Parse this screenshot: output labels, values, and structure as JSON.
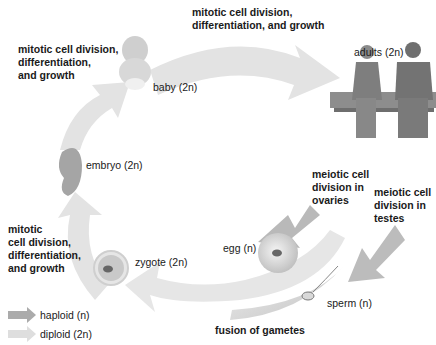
{
  "stages": {
    "baby": "baby (2n)",
    "adults": "adults (2n)",
    "embryo": "embryo (2n)",
    "zygote": "zygote (2n)",
    "egg": "egg (n)",
    "sperm": "sperm (n)"
  },
  "processes": {
    "top_left": [
      "mitotic cell division,",
      "differentiation,",
      "and growth"
    ],
    "top": [
      "mitotic cell division,",
      "differentiation, and growth"
    ],
    "left": [
      "mitotic",
      "cell division,",
      "differentiation,",
      "and growth"
    ],
    "ovaries": [
      "meiotic cell",
      "division in",
      "ovaries"
    ],
    "testes": [
      "meiotic cell",
      "division in",
      "testes"
    ],
    "fusion": "fusion of gametes"
  },
  "legend": [
    {
      "label": "haploid (n)",
      "color": "#a9a9a9"
    },
    {
      "label": "diploid (2n)",
      "color": "#dcdcdc"
    }
  ],
  "colors": {
    "diploid_arrow": "#e2e2e2",
    "haploid_arrow": "#b0b0b0"
  }
}
